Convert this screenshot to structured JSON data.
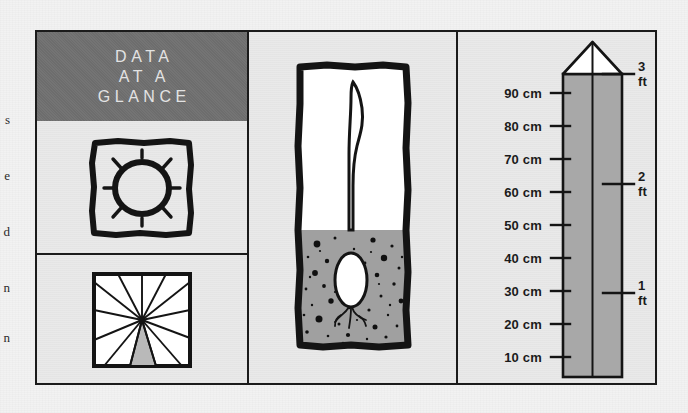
{
  "figure": {
    "title_lines": [
      "DATA",
      "AT A",
      "GLANCE"
    ],
    "colors": {
      "header_bg": "#6d6d6d",
      "header_text": "#e3e3e3",
      "ink": "#1b1b1b",
      "panel_bg": "#e9e9e9",
      "soil": "#a0a0a0",
      "ruler_fill": "#a8a8a8",
      "wedge_fill": "#b9b9b9",
      "paper": "#f2f2f2"
    }
  },
  "margin_text": {
    "fragments": [
      "s",
      "e",
      "d",
      "n",
      "n"
    ]
  },
  "icons": {
    "sun": {
      "name": "sun-icon",
      "rays": 8,
      "caption": ""
    },
    "sun_hours": {
      "name": "sun-hours-pie-icon",
      "segments": 12,
      "shaded_segments": 1
    },
    "seedling": {
      "name": "seedling-cross-section-icon",
      "soil_speckles": 46
    }
  },
  "ruler": {
    "name": "measuring-ruler",
    "unit_primary": "cm",
    "unit_secondary": "ft",
    "cm_ticks": [
      {
        "label": "90 cm",
        "value": 90
      },
      {
        "label": "80 cm",
        "value": 80
      },
      {
        "label": "70 cm",
        "value": 70
      },
      {
        "label": "60 cm",
        "value": 60
      },
      {
        "label": "50 cm",
        "value": 50
      },
      {
        "label": "40 cm",
        "value": 40
      },
      {
        "label": "30 cm",
        "value": 30
      },
      {
        "label": "20 cm",
        "value": 20
      },
      {
        "label": "10 cm",
        "value": 10
      }
    ],
    "ft_ticks": [
      {
        "label": "3 ft",
        "value": 3
      },
      {
        "label": "2 ft",
        "value": 2
      },
      {
        "label": "1 ft",
        "value": 1
      }
    ]
  }
}
